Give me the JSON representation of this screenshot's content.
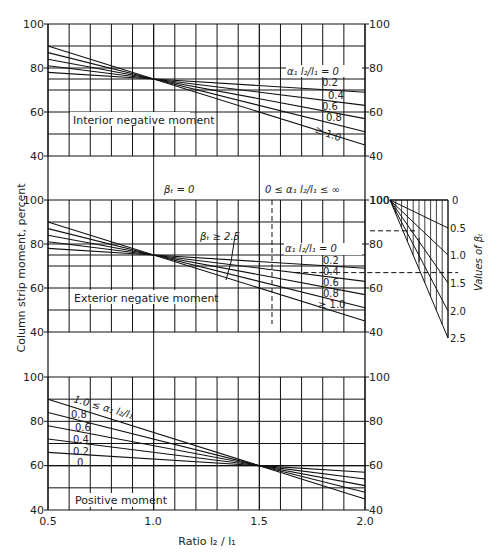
{
  "chart_data": {
    "type": "line",
    "xlabel": "Ratio l2/l1",
    "ylabel": "Column strip moment, percent",
    "x_ticks": [
      "0.5",
      "1.0",
      "1.5",
      "2.0"
    ],
    "y_ticks": [
      "40",
      "60",
      "80",
      "100"
    ],
    "xlim": [
      0.5,
      2.0
    ],
    "ylim": [
      40,
      100
    ],
    "grid": true,
    "panels": [
      {
        "title": "Interior negative moment",
        "legend_header": "α1 l2/l1 = 0",
        "series": [
          {
            "name": "α1 l2/l1 = 0",
            "x": [
              0.5,
              1.0,
              2.0
            ],
            "y": [
              75,
              75,
              75
            ]
          },
          {
            "name": "0.2",
            "x": [
              0.5,
              1.0,
              2.0
            ],
            "y": [
              78,
              75,
              69
            ]
          },
          {
            "name": "0.4",
            "x": [
              0.5,
              1.0,
              2.0
            ],
            "y": [
              81,
              75,
              63
            ]
          },
          {
            "name": "0.6",
            "x": [
              0.5,
              1.0,
              2.0
            ],
            "y": [
              84,
              75,
              57
            ]
          },
          {
            "name": "0.8",
            "x": [
              0.5,
              1.0,
              2.0
            ],
            "y": [
              87,
              75,
              51
            ]
          },
          {
            "name": "≥ 1.0",
            "x": [
              0.5,
              1.0,
              2.0
            ],
            "y": [
              90,
              75,
              45
            ]
          }
        ]
      },
      {
        "title": "Exterior negative moment",
        "annotations": [
          "βt = 0",
          "0 ≤ α1 l2/l1 ≤ ∞",
          "βt ≥ 2.5"
        ],
        "legend_header": "α1 l2/l1 = 0",
        "series_beta_0": [
          {
            "name": "all α1 l2/l1",
            "x": [
              0.5,
              2.0
            ],
            "y": [
              100,
              100
            ]
          }
        ],
        "series": [
          {
            "name": "α1 l2/l1 = 0",
            "x": [
              0.5,
              1.0,
              2.0
            ],
            "y": [
              75,
              75,
              75
            ]
          },
          {
            "name": "0.2",
            "x": [
              0.5,
              1.0,
              2.0
            ],
            "y": [
              78,
              75,
              69
            ]
          },
          {
            "name": "0.4",
            "x": [
              0.5,
              1.0,
              2.0
            ],
            "y": [
              81,
              75,
              63
            ]
          },
          {
            "name": "0.6",
            "x": [
              0.5,
              1.0,
              2.0
            ],
            "y": [
              84,
              75,
              57
            ]
          },
          {
            "name": "0.8",
            "x": [
              0.5,
              1.0,
              2.0
            ],
            "y": [
              87,
              75,
              51
            ]
          },
          {
            "name": "≥ 1.0",
            "x": [
              0.5,
              1.0,
              2.0
            ],
            "y": [
              90,
              75,
              45
            ]
          }
        ],
        "interpolation_scale": {
          "label": "Values of βt",
          "ticks": [
            "0",
            "0.5",
            "1.0",
            "1.5",
            "2.0",
            "2.5"
          ],
          "top_value": "100"
        }
      },
      {
        "title": "Positive moment",
        "series": [
          {
            "name": "0",
            "x": [
              0.5,
              1.5,
              2.0
            ],
            "y": [
              60,
              60,
              60
            ]
          },
          {
            "name": "0.2",
            "x": [
              0.5,
              1.5,
              2.0
            ],
            "y": [
              66,
              60,
              57
            ]
          },
          {
            "name": "0.4",
            "x": [
              0.5,
              1.5,
              2.0
            ],
            "y": [
              72,
              60,
              54
            ]
          },
          {
            "name": "0.6",
            "x": [
              0.5,
              1.5,
              2.0
            ],
            "y": [
              78,
              60,
              51
            ]
          },
          {
            "name": "0.8",
            "x": [
              0.5,
              1.5,
              2.0
            ],
            "y": [
              84,
              60,
              48
            ]
          },
          {
            "name": "1.0 ≤ α1 l2/l1",
            "x": [
              0.5,
              1.5,
              2.0
            ],
            "y": [
              90,
              60,
              45
            ]
          }
        ]
      }
    ]
  },
  "labels": {
    "ylabel": "Column strip moment, percent",
    "xlabel": "Ratio l₂ / l₁",
    "x_ticks": [
      "0.5",
      "1.0",
      "1.5",
      "2.0"
    ],
    "y_ticks": [
      "100",
      "80",
      "60",
      "40"
    ],
    "panel1_title": "Interior negative moment",
    "panel2_title": "Exterior negative moment",
    "panel3_title": "Positive moment",
    "legend_header": "α₁ l₂/l₁ = 0",
    "curve_labels": [
      "0.2",
      "0.4",
      "0.6",
      "0.8",
      "≥ 1.0"
    ],
    "pos_curve_labels": [
      "0.8",
      "0.6",
      "0.4",
      "0.2",
      "0"
    ],
    "pos_top_label": "1.0 ≤ α₁ l₂/l₁",
    "beta_zero": "βₜ = 0",
    "alpha_range": "0 ≤ α₁ l₂/l₁ ≤ ∞",
    "beta_ge": "βₜ ≥ 2.5",
    "beta_scale_title": "Values of βₜ",
    "beta_scale_ticks": [
      "0",
      "0.5",
      "1.0",
      "1.5",
      "2.0",
      "2.5"
    ],
    "beta_scale_top": "100"
  }
}
